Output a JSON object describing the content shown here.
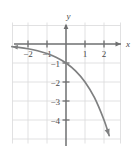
{
  "chart_data": {
    "type": "line",
    "title": "",
    "subtitle": "",
    "xlabel": "x",
    "ylabel": "y",
    "xlim": [
      -2.85,
      2.9
    ],
    "ylim": [
      -4.85,
      1.2
    ],
    "grid": true,
    "legend": null,
    "x_ticks": [
      {
        "value": -2,
        "label": "−2"
      },
      {
        "value": -1,
        "label": "−1"
      },
      {
        "value": 1,
        "label": "1"
      },
      {
        "value": 2,
        "label": "2"
      }
    ],
    "y_ticks": [
      {
        "value": -1,
        "label": "−1"
      },
      {
        "value": -2,
        "label": "−2"
      },
      {
        "value": -3,
        "label": "−3"
      },
      {
        "value": -4,
        "label": "−4"
      }
    ],
    "series": [
      {
        "name": "curve",
        "expression": "y = -2^x",
        "color": "#7f8081",
        "points": [
          {
            "x": -2.85,
            "y": -0.139
          },
          {
            "x": -2.5,
            "y": -0.177
          },
          {
            "x": -2.0,
            "y": -0.25
          },
          {
            "x": -1.5,
            "y": -0.354
          },
          {
            "x": -1.0,
            "y": -0.5
          },
          {
            "x": -0.5,
            "y": -0.707
          },
          {
            "x": 0.0,
            "y": -1.0
          },
          {
            "x": 0.5,
            "y": -1.414
          },
          {
            "x": 1.0,
            "y": -2.0
          },
          {
            "x": 1.5,
            "y": -2.828
          },
          {
            "x": 2.0,
            "y": -4.0
          },
          {
            "x": 2.27,
            "y": -4.82
          }
        ],
        "end_arrow": true,
        "start_arrow": true
      }
    ],
    "axis_color": "#6e6f70",
    "grid_color": "#d9d9da",
    "background": "#ffffff"
  },
  "labels": {
    "x_axis": "x",
    "y_axis": "y"
  }
}
